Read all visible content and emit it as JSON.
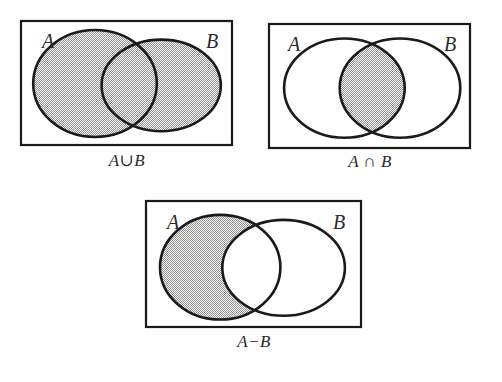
{
  "figure": {
    "background_color": "#fefefe",
    "stroke_color": "#1a1a1a",
    "shade_color": "#8c8c8c",
    "text_color": "#2b2b2b"
  },
  "panels": [
    {
      "id": "union",
      "caption": "A∪B",
      "label_a": "A",
      "label_b": "B",
      "shaded_region": "both-ellipses",
      "rect": {
        "x": 21,
        "y": 21,
        "width": 211,
        "height": 124
      },
      "ellipse_a": {
        "cx": 0.355,
        "cy": 0.5,
        "rx": 0.285,
        "ry": 0.415
      },
      "ellipse_b": {
        "cx": 0.66,
        "cy": 0.515,
        "rx": 0.275,
        "ry": 0.355
      }
    },
    {
      "id": "intersection",
      "caption": "A ∩ B",
      "label_a": "A",
      "label_b": "B",
      "shaded_region": "overlap-only",
      "rect": {
        "x": 269,
        "y": 23,
        "width": 201,
        "height": 124
      },
      "ellipse_a": {
        "cx": 0.375,
        "cy": 0.525,
        "rx": 0.3,
        "ry": 0.4
      },
      "ellipse_b": {
        "cx": 0.65,
        "cy": 0.525,
        "rx": 0.3,
        "ry": 0.4
      }
    },
    {
      "id": "difference",
      "caption": "A−B",
      "label_a": "A",
      "label_b": "B",
      "shaded_region": "a-minus-b",
      "rect": {
        "x": 146,
        "y": 201,
        "width": 215,
        "height": 126
      },
      "ellipse_a": {
        "cx": 0.345,
        "cy": 0.525,
        "rx": 0.28,
        "ry": 0.415
      },
      "ellipse_b": {
        "cx": 0.64,
        "cy": 0.53,
        "rx": 0.285,
        "ry": 0.38
      }
    }
  ]
}
